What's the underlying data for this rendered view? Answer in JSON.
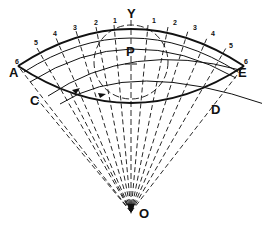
{
  "figure": {
    "type": "geometric construction",
    "colors": {
      "ink": "#111111",
      "background": "#ffffff"
    },
    "points": {
      "Y": {
        "label": "Y",
        "x": 127,
        "y": 7
      },
      "P": {
        "label": "P",
        "x": 126,
        "y": 45
      },
      "A": {
        "label": "A",
        "x": 9,
        "y": 66
      },
      "E": {
        "label": "E",
        "x": 238,
        "y": 66
      },
      "C": {
        "label": "C",
        "x": 30,
        "y": 94
      },
      "D": {
        "label": "D",
        "x": 211,
        "y": 103
      },
      "O": {
        "label": "O",
        "x": 139,
        "y": 207
      }
    },
    "left_divisions": [
      {
        "label": "1",
        "x": 113,
        "y": 17
      },
      {
        "label": "2",
        "x": 94,
        "y": 19
      },
      {
        "label": "3",
        "x": 73,
        "y": 24
      },
      {
        "label": "4",
        "x": 53,
        "y": 30
      },
      {
        "label": "5",
        "x": 34,
        "y": 39
      },
      {
        "label": "6",
        "x": 15,
        "y": 58
      }
    ],
    "right_divisions": [
      {
        "label": "1",
        "x": 152,
        "y": 17
      },
      {
        "label": "2",
        "x": 173,
        "y": 19
      },
      {
        "label": "3",
        "x": 193,
        "y": 24
      },
      {
        "label": "4",
        "x": 211,
        "y": 30
      },
      {
        "label": "5",
        "x": 229,
        "y": 42
      },
      {
        "label": "6",
        "x": 244,
        "y": 58
      }
    ]
  }
}
